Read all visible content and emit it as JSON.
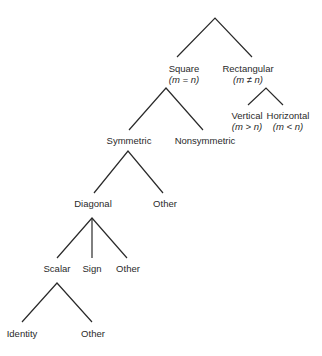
{
  "diagram": {
    "type": "tree",
    "stroke_color": "#2a2a2a",
    "nodes": {
      "square": {
        "label": "Square",
        "condition": "(m = n)"
      },
      "rectangular": {
        "label": "Rectangular",
        "condition": "(m ≠ n)"
      },
      "vertical": {
        "label": "Vertical",
        "condition": "(m > n)"
      },
      "horizontal": {
        "label": "Horizontal",
        "condition": "(m < n)"
      },
      "symmetric": {
        "label": "Symmetric"
      },
      "nonsymmetric": {
        "label": "Nonsymmetric"
      },
      "diagonal": {
        "label": "Diagonal"
      },
      "other_symmetric": {
        "label": "Other"
      },
      "scalar": {
        "label": "Scalar"
      },
      "sign": {
        "label": "Sign"
      },
      "other_diagonal": {
        "label": "Other"
      },
      "identity": {
        "label": "Identity"
      },
      "other_scalar": {
        "label": "Other"
      }
    },
    "edges": [
      [
        "root",
        "square"
      ],
      [
        "root",
        "rectangular"
      ],
      [
        "rectangular",
        "vertical"
      ],
      [
        "rectangular",
        "horizontal"
      ],
      [
        "square",
        "symmetric"
      ],
      [
        "square",
        "nonsymmetric"
      ],
      [
        "symmetric",
        "diagonal"
      ],
      [
        "symmetric",
        "other_symmetric"
      ],
      [
        "diagonal",
        "scalar"
      ],
      [
        "diagonal",
        "sign"
      ],
      [
        "diagonal",
        "other_diagonal"
      ],
      [
        "scalar",
        "identity"
      ],
      [
        "scalar",
        "other_scalar"
      ]
    ]
  }
}
